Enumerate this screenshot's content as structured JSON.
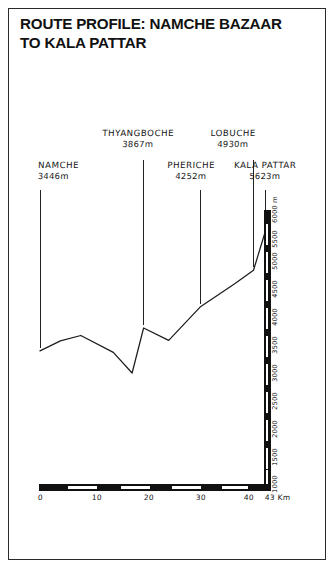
{
  "figure": {
    "title": "ROUTE PROFILE: NAMCHE BAZAAR\nTO KALA PATTAR",
    "frame_color": "#2b2b2b",
    "ink_color": "#141414",
    "background": "#ffffff"
  },
  "chart_data": {
    "type": "line",
    "title": "ROUTE PROFILE: NAMCHE BAZAAR TO KALA PATTAR",
    "xlabel": "43 Km",
    "ylabel": "6000 m",
    "xlim": [
      0,
      43
    ],
    "ylim": [
      1000,
      6000
    ],
    "grid": false,
    "legend": "none",
    "x_unit": "Km",
    "y_unit": "m",
    "x_ticks": [
      {
        "value": 0,
        "label": "0"
      },
      {
        "value": 10,
        "label": "10"
      },
      {
        "value": 20,
        "label": "20"
      },
      {
        "value": 30,
        "label": "30"
      },
      {
        "value": 40,
        "label": "40"
      },
      {
        "value": 43,
        "label": "43 Km"
      }
    ],
    "y_ticks": [
      {
        "value": 1000,
        "label": "1000"
      },
      {
        "value": 1500,
        "label": "1500"
      },
      {
        "value": 2000,
        "label": "2000"
      },
      {
        "value": 2500,
        "label": "2500"
      },
      {
        "value": 3000,
        "label": "3000"
      },
      {
        "value": 3500,
        "label": "3500"
      },
      {
        "value": 4000,
        "label": "4000"
      },
      {
        "value": 4500,
        "label": "4500"
      },
      {
        "value": 5000,
        "label": "5000"
      },
      {
        "value": 5500,
        "label": "5500"
      },
      {
        "value": 6000,
        "label": "6000 m"
      }
    ],
    "series": [
      {
        "name": "Elevation profile",
        "x": [
          0,
          3.9,
          7.8,
          14.0,
          17.6,
          19.8,
          24.6,
          30.6,
          37.2,
          40.8,
          43.0
        ],
        "values": [
          3446,
          3630,
          3730,
          3420,
          3040,
          3867,
          3640,
          4252,
          4680,
          4930,
          5623
        ]
      }
    ],
    "annotations": [
      {
        "name": "NAMCHE",
        "altitude": "3446m",
        "altitude_value": 3446,
        "km": 0.0
      },
      {
        "name": "THYANGBOCHE",
        "altitude": "3867m",
        "altitude_value": 3867,
        "km": 19.8
      },
      {
        "name": "PHERICHE",
        "altitude": "4252m",
        "altitude_value": 4252,
        "km": 30.6
      },
      {
        "name": "LOBUCHE",
        "altitude": "4930m",
        "altitude_value": 4930,
        "km": 40.8
      },
      {
        "name": "KALA PATTAR",
        "altitude": "5623m",
        "altitude_value": 5623,
        "km": 43.0
      }
    ]
  }
}
